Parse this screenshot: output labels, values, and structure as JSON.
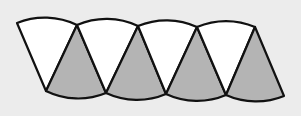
{
  "diagram": {
    "colors": {
      "background": "#ececec",
      "white_sector": "#ffffff",
      "gray_sector": "#b4b4b4",
      "stroke": "#111111"
    },
    "top_vertices_x": [
      17,
      77,
      138,
      197,
      255
    ],
    "bottom_vertices_x": [
      46,
      106,
      166,
      226,
      284
    ],
    "top_y": 25,
    "bottom_y": 93,
    "arc_sag": 6,
    "sectors": [
      {
        "type": "white",
        "orientation": "down"
      },
      {
        "type": "gray",
        "orientation": "up"
      },
      {
        "type": "white",
        "orientation": "down"
      },
      {
        "type": "gray",
        "orientation": "up"
      },
      {
        "type": "white",
        "orientation": "down"
      },
      {
        "type": "gray",
        "orientation": "up"
      },
      {
        "type": "white",
        "orientation": "down"
      },
      {
        "type": "gray",
        "orientation": "up"
      }
    ]
  }
}
